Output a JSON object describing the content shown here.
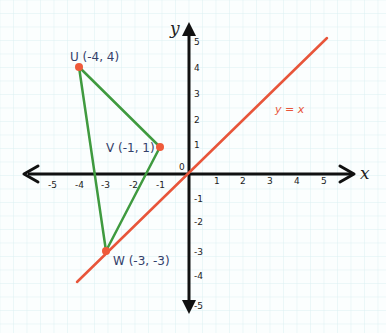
{
  "graph": {
    "x_axis_label": "x",
    "y_axis_label": "y",
    "origin_label": "0",
    "x_ticks": [
      "-5",
      "-4",
      "-3",
      "-2",
      "-1",
      "1",
      "2",
      "3",
      "4",
      "5"
    ],
    "y_ticks": [
      "5",
      "4",
      "3",
      "2",
      "1",
      "-1",
      "-2",
      "-3",
      "-4",
      "-5"
    ],
    "line_label": "y = x",
    "points": [
      {
        "name": "U",
        "label": "U (-4, 4)",
        "x": -4,
        "y": 4
      },
      {
        "name": "V",
        "label": "V (-1, 1)",
        "x": -1,
        "y": 1
      },
      {
        "name": "W",
        "label": "W (-3, -3)",
        "x": -3,
        "y": -3
      }
    ],
    "colors": {
      "triangle": "#3f9a3f",
      "line": "#e8553a",
      "point": "#ef5a3a",
      "axis": "#111111",
      "grid": "#dceff2",
      "label": "#34406a"
    }
  }
}
